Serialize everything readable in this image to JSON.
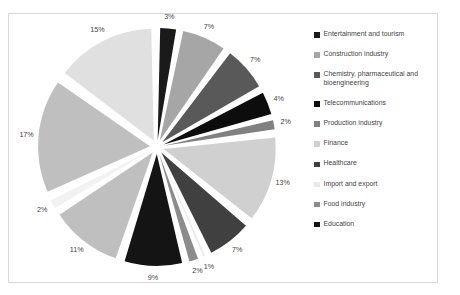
{
  "chart_data": {
    "type": "pie",
    "title": "",
    "legend_position": "right",
    "exploded": true,
    "unit": "%",
    "categories": [
      "Entertainment and tourism",
      "Construction industry",
      "Chemistry, pharmaceutical and bioengineering",
      "Telecommunications",
      "Production industry",
      "Finance",
      "Healthcare",
      "Import and export",
      "Food industry",
      "Education"
    ],
    "values": [
      3,
      7,
      7,
      4,
      2,
      13,
      7,
      1,
      2,
      9
    ],
    "labels": [
      "3%",
      "7%",
      "7%",
      "4%",
      "2%",
      "13%",
      "7%",
      "1%",
      "2%",
      "9%"
    ],
    "colors": [
      "#1a1a1a",
      "#a6a6a6",
      "#595959",
      "#0d0d0d",
      "#808080",
      "#d0d0d0",
      "#404040",
      "#e8e8e8",
      "#8c8c8c",
      "#141414"
    ],
    "extra_slices": [
      {
        "label": "11%",
        "value": 11,
        "color": "#bfbfbf"
      },
      {
        "label": "2%",
        "value": 2,
        "color": "#f2f2f2"
      },
      {
        "label": "17%",
        "value": 17,
        "color": "#bfbfbf"
      },
      {
        "label": "15%",
        "value": 15,
        "color": "#e0e0e0"
      }
    ],
    "all_slice_labels": [
      "3%",
      "7%",
      "7%",
      "4%",
      "2%",
      "13%",
      "7%",
      "1%",
      "2%",
      "9%",
      "11%",
      "2%",
      "17%",
      "15%"
    ],
    "all_slice_values": [
      3,
      7,
      7,
      4,
      2,
      13,
      7,
      1,
      2,
      9,
      11,
      2,
      17,
      15
    ],
    "all_slice_colors": [
      "#1a1a1a",
      "#a6a6a6",
      "#595959",
      "#0d0d0d",
      "#808080",
      "#d0d0d0",
      "#404040",
      "#e8e8e8",
      "#8c8c8c",
      "#141414",
      "#bfbfbf",
      "#f2f2f2",
      "#bfbfbf",
      "#e0e0e0"
    ]
  },
  "legend": {
    "items": [
      {
        "label": "Entertainment and tourism",
        "color": "#1a1a1a"
      },
      {
        "label": "Construction industry",
        "color": "#a6a6a6"
      },
      {
        "label": "Chemistry, pharmaceutical and bioengineering",
        "color": "#595959"
      },
      {
        "label": "Telecommunications",
        "color": "#0d0d0d"
      },
      {
        "label": "Production industry",
        "color": "#808080"
      },
      {
        "label": "Finance",
        "color": "#d0d0d0"
      },
      {
        "label": "Healthcare",
        "color": "#404040"
      },
      {
        "label": "Import and export",
        "color": "#e8e8e8"
      },
      {
        "label": "Food industry",
        "color": "#8c8c8c"
      },
      {
        "label": "Education",
        "color": "#141414"
      }
    ]
  },
  "style": {
    "frame_border_color": "#d9d9d9",
    "background": "#ffffff",
    "label_text_color": "#3f3f3f"
  }
}
